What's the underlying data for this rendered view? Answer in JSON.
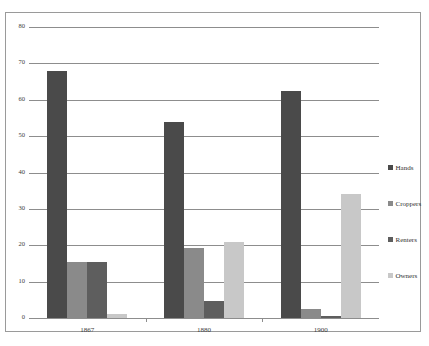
{
  "chart_data": {
    "type": "bar",
    "title": "",
    "subtitle": "",
    "xlabel": "",
    "ylabel": "",
    "categories": [
      "1867",
      "1880",
      "1900"
    ],
    "series": [
      {
        "name": "Hands",
        "color": "#4a4a4a",
        "values": [
          68,
          54,
          62.5
        ]
      },
      {
        "name": "Croppers",
        "color": "#8a8a8a",
        "values": [
          15.3,
          19.2,
          2.5
        ]
      },
      {
        "name": "Renters",
        "color": "#5e5e5e",
        "values": [
          15.5,
          4.6,
          0.5
        ]
      },
      {
        "name": "Owners",
        "color": "#c8c8c8",
        "values": [
          1,
          21,
          34
        ]
      }
    ],
    "ylim": [
      0,
      80
    ],
    "yticks": [
      0,
      10,
      20,
      30,
      40,
      50,
      60,
      70,
      80
    ],
    "ytick_labels": [
      "0",
      "10",
      "20",
      "30",
      "40",
      "50",
      "60",
      "70",
      "80"
    ],
    "grid": true,
    "legend_position": "right",
    "grouped": true
  },
  "colors": {
    "grid": "#8d8d8d",
    "frame": "#9a9a9a",
    "text": "#3a3a3a",
    "background": "#ffffff"
  }
}
